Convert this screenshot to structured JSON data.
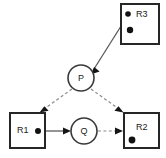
{
  "diagram": {
    "type": "petri-net",
    "background_color": "#ffffff",
    "stroke_color": "#262626",
    "dashed_arc_color": "#8a8a8a",
    "solid_arc_color": "#5a5a5a",
    "token_color": "#111111",
    "places": [
      {
        "id": "R1",
        "label": "R1",
        "shape": "rectangle",
        "x": 10,
        "y": 113,
        "width": 35,
        "height": 35,
        "label_x": 24,
        "label_y": 131,
        "tokens": 1,
        "token_positions": [
          {
            "cx": 39,
            "cy": 131,
            "r": 3
          }
        ]
      },
      {
        "id": "R2",
        "label": "R2",
        "shape": "rectangle",
        "x": 124,
        "y": 113,
        "width": 35,
        "height": 35,
        "label_x": 143,
        "label_y": 128,
        "tokens": 1,
        "token_positions": [
          {
            "cx": 132,
            "cy": 140,
            "r": 3.4
          }
        ]
      },
      {
        "id": "R3",
        "label": "R3",
        "shape": "rectangle",
        "x": 121,
        "y": 4,
        "width": 38,
        "height": 40,
        "label_x": 141,
        "label_y": 14,
        "tokens": 2,
        "token_positions": [
          {
            "cx": 129,
            "cy": 14,
            "r": 2.8
          },
          {
            "cx": 131,
            "cy": 30,
            "r": 3.2
          }
        ]
      }
    ],
    "transitions": [
      {
        "id": "P",
        "label": "P",
        "shape": "circle",
        "cx": 81,
        "cy": 78,
        "r": 13,
        "label_x": 81,
        "label_y": 79
      },
      {
        "id": "Q",
        "label": "Q",
        "shape": "circle",
        "cx": 84,
        "cy": 131,
        "r": 13,
        "label_x": 84,
        "label_y": 132
      }
    ],
    "arcs": [
      {
        "id": "R3-to-P",
        "from": "R3",
        "to": "P",
        "style": "solid",
        "x1": 128,
        "y1": 15,
        "x2": 93,
        "y2": 70,
        "arrowhead": true
      },
      {
        "id": "P-to-R1",
        "from": "P",
        "to": "R1",
        "style": "dashed",
        "x1": 72,
        "y1": 89,
        "x2": 42,
        "y2": 111,
        "arrowhead": true
      },
      {
        "id": "P-to-R2",
        "from": "P",
        "to": "R2",
        "style": "dashed",
        "x1": 91,
        "y1": 89,
        "x2": 121,
        "y2": 111,
        "arrowhead": true
      },
      {
        "id": "R1-to-Q",
        "from": "R1",
        "to": "Q",
        "style": "solid",
        "x1": 41,
        "y1": 131,
        "x2": 70,
        "y2": 131,
        "arrowhead": true
      },
      {
        "id": "Q-to-R2",
        "from": "Q",
        "to": "R2",
        "style": "dashed",
        "x1": 98,
        "y1": 131,
        "x2": 123,
        "y2": 131,
        "arrowhead": true
      }
    ]
  }
}
